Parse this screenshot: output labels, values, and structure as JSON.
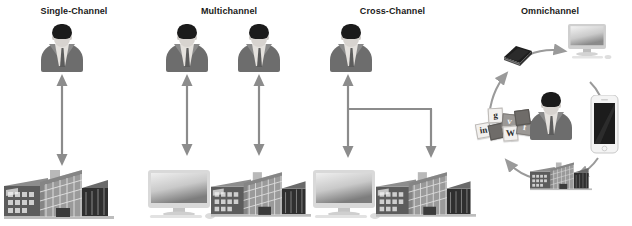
{
  "figure": {
    "type": "diagram",
    "background_color": "#ffffff",
    "title_color": "#1a1a1a",
    "arrow_color": "#8c8c8c",
    "panels": [
      {
        "id": "single-channel",
        "title": "Single-Channel",
        "actors": [
          "customer-person"
        ],
        "channels": [
          "retail-store-building"
        ],
        "connections": [
          {
            "from": "retail-store-building",
            "to": "customer-person",
            "style": "double-headed-arrow"
          }
        ]
      },
      {
        "id": "multichannel",
        "title": "Multichannel",
        "actors": [
          "customer-person",
          "customer-person"
        ],
        "channels": [
          "desktop-computer",
          "retail-store-building"
        ],
        "connections": [
          {
            "from": "desktop-computer",
            "to": "customer-person",
            "style": "double-headed-arrow"
          },
          {
            "from": "retail-store-building",
            "to": "customer-person",
            "style": "double-headed-arrow"
          }
        ]
      },
      {
        "id": "cross-channel",
        "title": "Cross-Channel",
        "actors": [
          "customer-person"
        ],
        "channels": [
          "desktop-computer",
          "retail-store-building"
        ],
        "connections": [
          {
            "from": "desktop-computer",
            "to": "customer-person",
            "style": "double-headed-arrow"
          },
          {
            "from": "cross-link",
            "to": "retail-store-building",
            "style": "single-headed-arrow"
          }
        ]
      },
      {
        "id": "omnichannel",
        "title": "Omnichannel",
        "actors": [
          "customer-person"
        ],
        "channels": [
          "catalog-book",
          "desktop-computer",
          "smartphone",
          "retail-store-building",
          "social-media-tiles"
        ],
        "connections": [
          {
            "from": "catalog-book",
            "to": "desktop-computer",
            "style": "curved-arrow"
          },
          {
            "from": "desktop-computer",
            "to": "smartphone",
            "style": "curved-arrow"
          },
          {
            "from": "smartphone",
            "to": "retail-store-building",
            "style": "curved-arrow"
          },
          {
            "from": "retail-store-building",
            "to": "social-media-tiles",
            "style": "curved-arrow"
          },
          {
            "from": "social-media-tiles",
            "to": "catalog-book",
            "style": "curved-arrow"
          }
        ],
        "social_tiles": [
          {
            "label": "in",
            "name": "linkedin-tile"
          },
          {
            "label": "g",
            "name": "googleplus-tile"
          },
          {
            "label": "v",
            "name": "vimeo-tile"
          },
          {
            "label": "W",
            "name": "wordpress-tile"
          },
          {
            "label": "f",
            "name": "facebook-tile"
          }
        ]
      }
    ]
  }
}
